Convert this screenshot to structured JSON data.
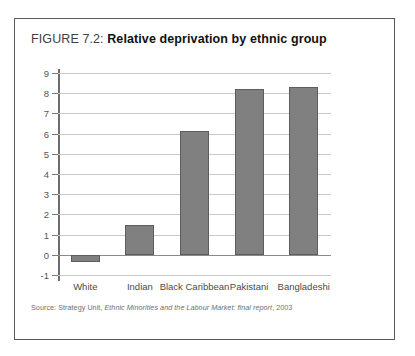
{
  "figure": {
    "label": "FIGURE 7.2:",
    "name": "Relative deprivation by ethnic group",
    "source_prefix": "Source: Strategy Unit, ",
    "source_italic": "Ethnic Minorities and the Labour Market: final report",
    "source_suffix": ", 2003"
  },
  "colors": {
    "bar_fill": "#808080",
    "bar_border": "#5d5d5d",
    "gridline": "#c9c9c9",
    "axis": "#6b6b6b",
    "frame": "#5a5a5a"
  },
  "chart_data": {
    "type": "bar",
    "title": "Relative deprivation by ethnic group",
    "xlabel": "",
    "ylabel": "",
    "categories": [
      "White",
      "Indian",
      "Black Caribbean",
      "Pakistani",
      "Bangladeshi"
    ],
    "values": [
      -0.35,
      1.5,
      6.15,
      8.2,
      8.3
    ],
    "ylim": [
      -1,
      9
    ],
    "yticks": [
      -1,
      0,
      1,
      2,
      3,
      4,
      5,
      6,
      7,
      8,
      9
    ],
    "ytick_labels": [
      "-1",
      "0",
      "1",
      "2",
      "3",
      "4",
      "5",
      "6",
      "7",
      "8",
      "9"
    ],
    "grid": true,
    "legend": false,
    "series": [
      {
        "name": "Relative deprivation",
        "values": [
          -0.35,
          1.5,
          6.15,
          8.2,
          8.3
        ]
      }
    ]
  }
}
